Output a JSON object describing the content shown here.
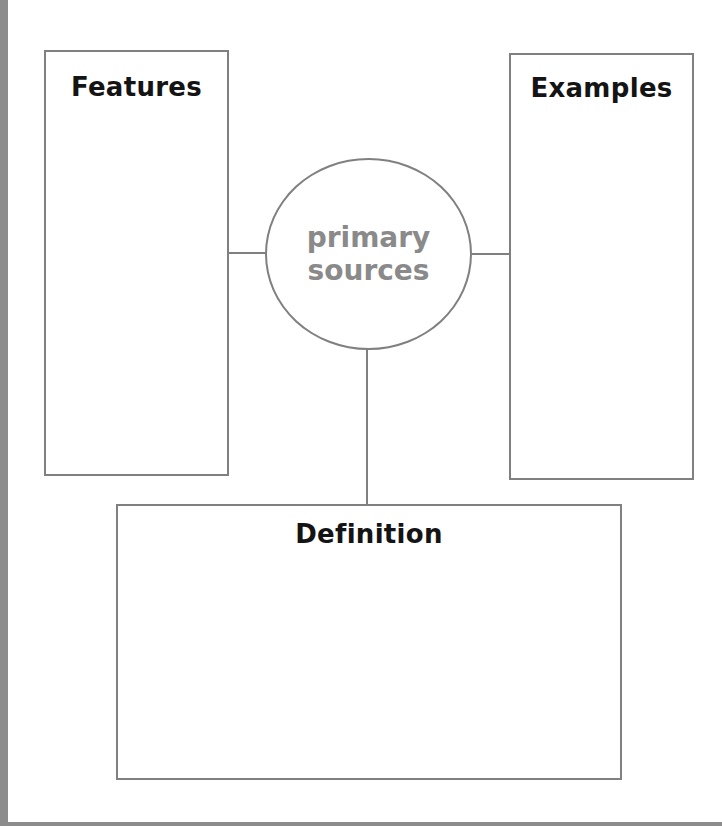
{
  "diagram": {
    "type": "graphic-organizer",
    "center_topic": {
      "line1": "primary",
      "line2": "sources",
      "color": "#8a8a8a"
    },
    "boxes": {
      "features": {
        "title": "Features"
      },
      "examples": {
        "title": "Examples"
      },
      "definition": {
        "title": "Definition"
      }
    },
    "colors": {
      "border": "#808080",
      "title_text": "#141414",
      "page_edge": "#8c8c8c"
    }
  }
}
